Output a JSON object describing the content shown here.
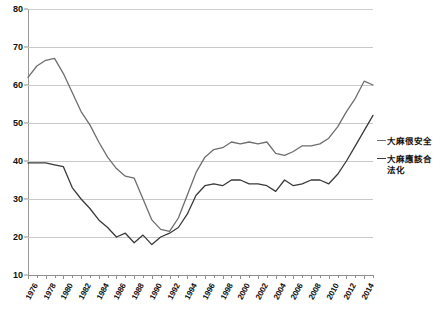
{
  "chart_data": {
    "type": "line",
    "title": "",
    "subtitle": "",
    "xlabel": "",
    "ylabel": "",
    "ylim": [
      10,
      80
    ],
    "yticks": [
      10,
      20,
      30,
      40,
      50,
      60,
      70,
      80
    ],
    "xlim": [
      1976,
      2015
    ],
    "grid": true,
    "legend_position": "right",
    "x": [
      1976,
      1977,
      1978,
      1979,
      1980,
      1981,
      1982,
      1983,
      1984,
      1985,
      1986,
      1987,
      1988,
      1989,
      1990,
      1991,
      1992,
      1993,
      1994,
      1995,
      1996,
      1997,
      1998,
      1999,
      2000,
      2001,
      2002,
      2003,
      2004,
      2005,
      2006,
      2007,
      2008,
      2009,
      2010,
      2011,
      2012,
      2013,
      2014,
      2015
    ],
    "xtick_labels": [
      "1976",
      "1978",
      "1980",
      "1982",
      "1984",
      "1986",
      "1988",
      "1990",
      "1992",
      "1994",
      "1996",
      "1998",
      "2000",
      "2002",
      "2004",
      "2006",
      "2008",
      "2010",
      "2012",
      "2014"
    ],
    "xtick_years": [
      1976,
      1978,
      1980,
      1982,
      1984,
      1986,
      1988,
      1990,
      1992,
      1994,
      1996,
      1998,
      2000,
      2002,
      2004,
      2006,
      2008,
      2010,
      2012,
      2014
    ],
    "series": [
      {
        "name": "大麻很安全",
        "color": "#6e6e6e",
        "values": [
          62,
          65,
          66.5,
          67,
          63,
          58,
          53,
          49.5,
          45,
          41,
          38,
          36,
          35.5,
          30,
          24.5,
          22,
          21.5,
          25,
          31,
          37,
          41,
          43,
          43.5,
          45,
          44.5,
          45,
          44.5,
          45,
          42,
          41.5,
          42.5,
          44,
          44,
          44.5,
          46,
          49,
          53,
          56.5,
          61,
          60
        ]
      },
      {
        "name": "大麻應該合法化",
        "color": "#3a3a3a",
        "values": [
          39.5,
          39.5,
          39.5,
          39,
          38.5,
          33,
          30,
          27.5,
          24.5,
          22.5,
          20,
          21,
          18.5,
          20.5,
          18,
          20,
          21,
          22.5,
          26,
          31,
          33.5,
          34,
          33.5,
          35,
          35,
          34,
          34,
          33.5,
          32,
          35,
          33.5,
          34,
          35,
          35,
          34,
          36.5,
          40,
          44,
          48,
          52
        ]
      }
    ],
    "annotations": []
  },
  "legend": {
    "entries": [
      {
        "label": "大麻很安全"
      },
      {
        "label": "大麻應該合法化"
      }
    ]
  },
  "caption": {
    "text": ""
  }
}
